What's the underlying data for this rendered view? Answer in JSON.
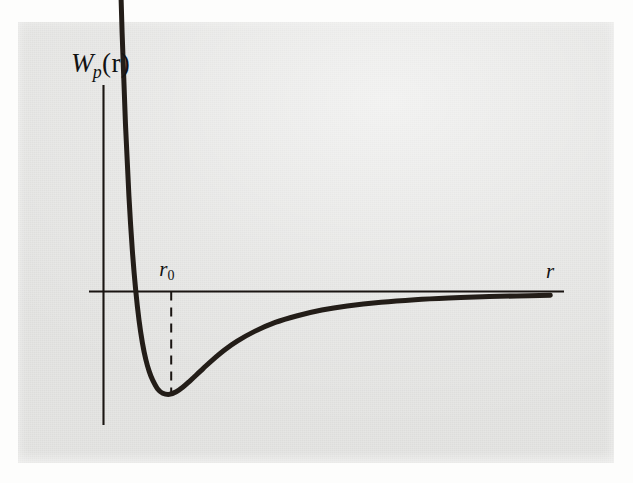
{
  "figure": {
    "kind": "potential-energy-curve",
    "background_color": "#fdfdfc",
    "plate_color": "#e5e5e3",
    "ink_color": "#1a1512"
  },
  "labels": {
    "y_axis_main": "W",
    "y_axis_sub": "p",
    "y_axis_arg": "(r)",
    "x_axis": "r",
    "minimum_main": "r",
    "minimum_sub": "0"
  },
  "chart_data": {
    "type": "line",
    "title": "",
    "xlabel": "r",
    "ylabel": "W_p(r)",
    "series": [
      {
        "name": "W_p(r)",
        "comment": "Lennard-Jones style interatomic potential energy vs separation",
        "x": [
          0.84,
          0.87,
          0.9,
          0.94,
          0.98,
          1.02,
          1.06,
          1.1,
          1.14,
          1.18,
          1.22,
          1.26,
          1.3,
          1.36,
          1.42,
          1.5,
          1.58,
          1.66,
          1.74,
          1.82,
          1.9,
          2.0,
          2.15,
          2.3,
          2.5,
          2.75,
          3.0,
          3.3,
          3.6,
          4.0,
          4.4,
          4.8,
          5.2,
          5.6,
          6.0
        ],
        "y": [
          3.72,
          2.9,
          2.22,
          1.52,
          0.98,
          0.565,
          0.248,
          0.01,
          -0.17,
          -0.303,
          -0.4,
          -0.47,
          -0.52,
          -0.573,
          -0.598,
          -0.605,
          -0.59,
          -0.562,
          -0.527,
          -0.49,
          -0.452,
          -0.406,
          -0.344,
          -0.292,
          -0.236,
          -0.182,
          -0.144,
          -0.109,
          -0.085,
          -0.063,
          -0.048,
          -0.038,
          -0.031,
          -0.026,
          -0.022
        ]
      }
    ],
    "annotations": [
      {
        "name": "equilibrium-separation",
        "label": "r_0",
        "x": 1.52,
        "y": -0.605,
        "style": "dashed-vertical-dropline"
      }
    ],
    "axes": {
      "x_axis_at_y": 0,
      "y_axis_at_x": 0.72,
      "xlim": [
        0.72,
        6.15
      ],
      "ylim": [
        -1.05,
        4.25
      ],
      "grid": false,
      "ticks": false,
      "legend": false
    }
  }
}
